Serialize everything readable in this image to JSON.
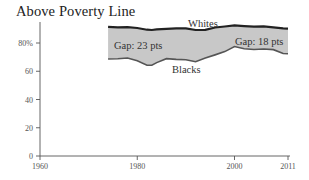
{
  "title": "Above Poverty Line",
  "chart_data": {
    "type": "area",
    "title": "Above Poverty Line",
    "xlabel": "",
    "ylabel": "",
    "xlim": [
      1960,
      2011
    ],
    "ylim": [
      0,
      90
    ],
    "x_ticks": [
      1960,
      1980,
      2000,
      2011
    ],
    "y_ticks": [
      "0",
      "20",
      "40",
      "60",
      "80%"
    ],
    "grid": false,
    "legend": "inline labels",
    "x": [
      1974,
      1976,
      1978,
      1980,
      1982,
      1983,
      1984,
      1986,
      1988,
      1990,
      1992,
      1994,
      1996,
      1998,
      2000,
      2002,
      2004,
      2006,
      2008,
      2010,
      2011
    ],
    "series": [
      {
        "name": "Whites",
        "values": [
          91.4,
          91.0,
          91.3,
          90.6,
          89.4,
          89.2,
          89.6,
          90.0,
          90.3,
          90.3,
          89.2,
          89.3,
          91.0,
          91.7,
          92.5,
          92.0,
          91.6,
          91.8,
          91.1,
          90.4,
          90.2
        ]
      },
      {
        "name": "Blacks",
        "values": [
          68.7,
          68.9,
          69.4,
          67.5,
          64.3,
          64.2,
          66.1,
          68.9,
          68.4,
          68.1,
          66.7,
          69.4,
          71.6,
          73.9,
          77.5,
          75.9,
          75.4,
          75.7,
          75.3,
          72.6,
          72.4
        ]
      }
    ],
    "annotations": [
      {
        "text": "Whites",
        "position": "above white line, ~1990"
      },
      {
        "text": "Blacks",
        "position": "below black line, ~1988"
      },
      {
        "text": "Gap: 23 pts",
        "position": "inside band, left"
      },
      {
        "text": "Gap: 18 pts",
        "position": "inside band, right"
      }
    ],
    "band_fill": "#c8c8c8",
    "line_color": "#222222"
  },
  "labels": {
    "whites": "Whites",
    "blacks": "Blacks",
    "gap_left": "Gap: 23 pts",
    "gap_right": "Gap: 18 pts"
  },
  "axis": {
    "x_ticks": [
      "1960",
      "1980",
      "2000",
      "2011"
    ],
    "y_ticks": [
      "0",
      "20",
      "40",
      "60",
      "80%"
    ]
  }
}
